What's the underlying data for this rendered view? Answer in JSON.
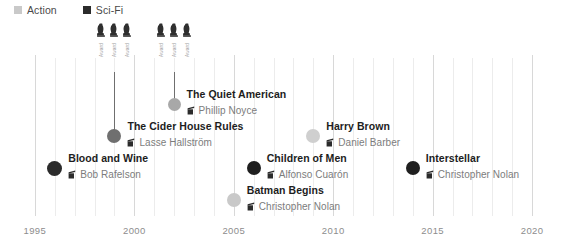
{
  "legend": {
    "items": [
      {
        "label": "Action",
        "color": "#c9c9c9",
        "swatch_icon": "square-swatch-icon"
      },
      {
        "label": "Sci-Fi",
        "color": "#2b2b2b",
        "swatch_icon": "square-swatch-icon"
      }
    ]
  },
  "axis": {
    "label": "",
    "ticks": [
      "1995",
      "2000",
      "2005",
      "2010",
      "2015",
      "2020"
    ],
    "min": 1994,
    "max": 2021
  },
  "award_clusters": [
    {
      "id": "awards-1999",
      "year": 1999,
      "awards": [
        {
          "icon": "award-trophy-icon",
          "text": "Award"
        },
        {
          "icon": "award-trophy-icon",
          "text": "Award"
        },
        {
          "icon": "award-trophy-icon",
          "text": "Award"
        }
      ]
    },
    {
      "id": "awards-2002",
      "year": 2002,
      "awards": [
        {
          "icon": "award-trophy-icon",
          "text": "Award"
        },
        {
          "icon": "award-trophy-icon",
          "text": "Award"
        },
        {
          "icon": "award-trophy-icon",
          "text": "Award"
        }
      ]
    }
  ],
  "chart_data": {
    "type": "scatter",
    "title": "",
    "xlabel": "",
    "ylabel": "",
    "xlim": [
      1994,
      2021
    ],
    "grid": true,
    "legend_position": "top-left",
    "categories": [
      "Action",
      "Sci-Fi"
    ],
    "points": [
      {
        "title": "Blood and Wine",
        "director": "Bob Rafelson",
        "year": 1996,
        "genre": "Sci-Fi",
        "color": "#2b2b2b",
        "dot_size": 15,
        "row": 4,
        "has_awards": false
      },
      {
        "title": "The Cider House Rules",
        "director": "Lasse Hallström",
        "year": 1999,
        "genre": "Action",
        "color": "#6f6f6f",
        "dot_size": 14,
        "row": 3,
        "has_awards": true
      },
      {
        "title": "The Quiet American",
        "director": "Phillip Noyce",
        "year": 2002,
        "genre": "Action",
        "color": "#a8a8a8",
        "dot_size": 13,
        "row": 2,
        "has_awards": true
      },
      {
        "title": "Batman Begins",
        "director": "Christopher Nolan",
        "year": 2005,
        "genre": "Action",
        "color": "#c9c9c9",
        "dot_size": 14,
        "row": 5,
        "has_awards": false
      },
      {
        "title": "Children of Men",
        "director": "Alfonso Cuarón",
        "year": 2006,
        "genre": "Sci-Fi",
        "color": "#1f1f1f",
        "dot_size": 14,
        "row": 4,
        "has_awards": false
      },
      {
        "title": "Harry Brown",
        "director": "Daniel Barber",
        "year": 2009,
        "genre": "Action",
        "color": "#cfcfcf",
        "dot_size": 14,
        "row": 3,
        "has_awards": false
      },
      {
        "title": "Interstellar",
        "director": "Christopher Nolan",
        "year": 2014,
        "genre": "Sci-Fi",
        "color": "#1f1f1f",
        "dot_size": 14,
        "row": 4,
        "has_awards": false
      }
    ]
  }
}
